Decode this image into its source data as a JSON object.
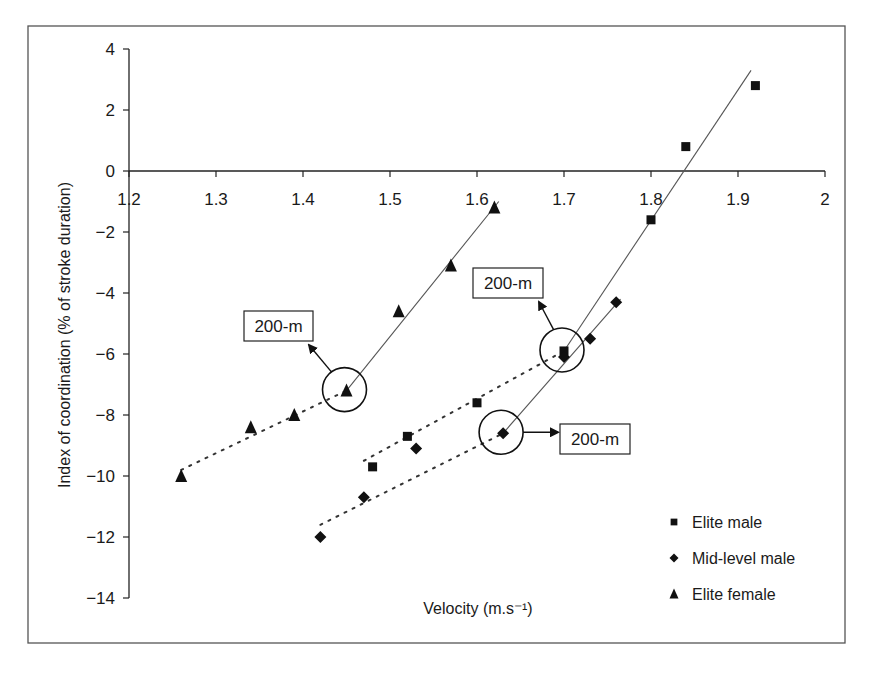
{
  "chart_data": {
    "type": "scatter",
    "title": "",
    "xlabel": "Velocity (m.s⁻¹)",
    "ylabel": "Index of coordination (% of stroke duration)",
    "xlim": [
      1.2,
      2.0
    ],
    "ylim": [
      -14,
      4
    ],
    "x_ticks": [
      "1.2",
      "1.3",
      "1.4",
      "1.5",
      "1.6",
      "1.7",
      "1.8",
      "1.9",
      "2"
    ],
    "x_tick_values": [
      1.2,
      1.3,
      1.4,
      1.5,
      1.6,
      1.7,
      1.8,
      1.9,
      2.0
    ],
    "y_ticks": [
      "4",
      "2",
      "0",
      "−2",
      "−4",
      "−6",
      "−8",
      "−10",
      "−12",
      "−14"
    ],
    "y_tick_values": [
      4,
      2,
      0,
      -2,
      -4,
      -6,
      -8,
      -10,
      -12,
      -14
    ],
    "grid": false,
    "legend_position": "lower right",
    "series": [
      {
        "name": "Elite male",
        "marker": "square",
        "color": "#111111",
        "x": [
          1.48,
          1.52,
          1.6,
          1.7,
          1.8,
          1.84,
          1.92
        ],
        "y": [
          -9.7,
          -8.7,
          -7.6,
          -5.9,
          -1.6,
          0.8,
          2.8
        ],
        "trend_dotted": {
          "x": [
            1.47,
            1.7
          ],
          "y": [
            -9.5,
            -5.9
          ]
        },
        "trend_solid": {
          "x": [
            1.7,
            1.915
          ],
          "y": [
            -5.9,
            3.3
          ]
        }
      },
      {
        "name": "Mid-level male",
        "marker": "diamond",
        "color": "#111111",
        "x": [
          1.42,
          1.47,
          1.53,
          1.63,
          1.7,
          1.73,
          1.76
        ],
        "y": [
          -12.0,
          -10.7,
          -9.1,
          -8.6,
          -6.1,
          -5.5,
          -4.3
        ],
        "trend_dotted": {
          "x": [
            1.42,
            1.63
          ],
          "y": [
            -11.6,
            -8.6
          ]
        },
        "trend_solid": {
          "x": [
            1.63,
            1.765
          ],
          "y": [
            -8.6,
            -4.2
          ]
        }
      },
      {
        "name": "Elite female",
        "marker": "triangle",
        "color": "#111111",
        "x": [
          1.26,
          1.34,
          1.39,
          1.45,
          1.51,
          1.57,
          1.62
        ],
        "y": [
          -10.0,
          -8.4,
          -8.0,
          -7.2,
          -4.6,
          -3.1,
          -1.2
        ],
        "trend_dotted": {
          "x": [
            1.26,
            1.45
          ],
          "y": [
            -9.8,
            -7.2
          ]
        },
        "trend_solid": {
          "x": [
            1.45,
            1.625
          ],
          "y": [
            -7.2,
            -1.0
          ]
        }
      }
    ],
    "annotations": [
      {
        "text": "200-m",
        "series": "Elite female",
        "point": [
          1.45,
          -7.2
        ],
        "box": [
          244,
          311,
          69,
          30
        ],
        "arrow_to_box": true
      },
      {
        "text": "200-m",
        "series": "Elite male",
        "point": [
          1.7,
          -5.9
        ],
        "box": [
          473,
          268,
          70,
          30
        ],
        "arrow_to_box": true
      },
      {
        "text": "200-m",
        "series": "Mid-level male",
        "point": [
          1.63,
          -8.6
        ],
        "box": [
          560,
          424,
          70,
          30
        ],
        "arrow_to_box": true
      }
    ]
  }
}
